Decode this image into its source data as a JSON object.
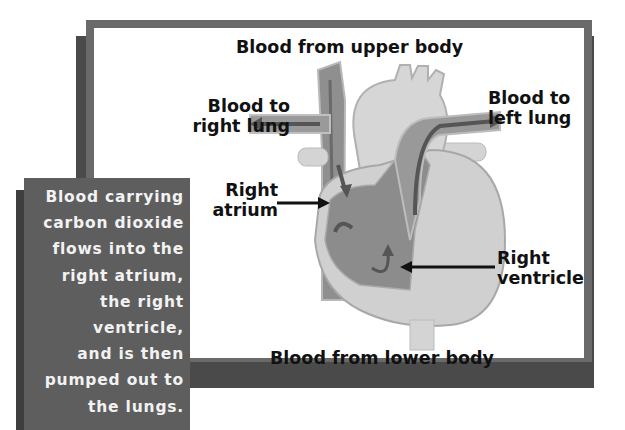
{
  "diagram": {
    "title_top": "Blood from upper body",
    "title_bottom": "Blood from lower body",
    "labels": {
      "right_lung": "Blood to\nright lung",
      "left_lung": "Blood to\nleft lung",
      "right_atrium": "Right\natrium",
      "right_ventricle": "Right\nventricle"
    },
    "description": "Blood carrying\ncarbon dioxide\nflows into the\nright atrium,\nthe right\nventricle,\nand is then\npumped out to\nthe lungs.",
    "colors": {
      "frame": "#6a6a6a",
      "frame_shadow": "#4a4a4a",
      "panel": "#5e5e5e",
      "heart_light": "#d4d4d4",
      "heart_dark": "#8c8c8c",
      "arrow": "#111111"
    }
  }
}
